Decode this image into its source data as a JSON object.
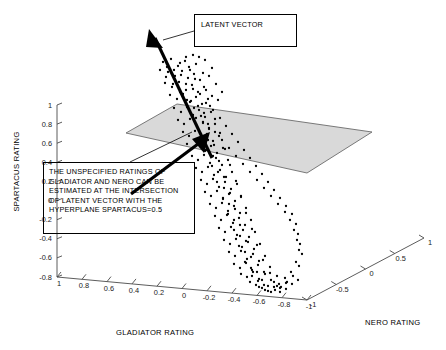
{
  "chart_data": {
    "type": "scatter",
    "title": "",
    "projection": "3d",
    "xlabel": "GLADIATOR RATING",
    "ylabel": "SPARTACUS RATING",
    "zlabel": "NERO RATING",
    "xlim": [
      1,
      -1
    ],
    "ylim": [
      -0.8,
      1
    ],
    "zlim": [
      -1,
      1
    ],
    "grid": false,
    "legend": null,
    "xticks": [
      "1",
      "0.8",
      "0.6",
      "0.4",
      "0.2",
      "0",
      "-0.2",
      "-0.4",
      "-0.6",
      "-0.8",
      "-1"
    ],
    "yticks": [
      "1",
      "0.8",
      "0.6",
      "0.4",
      "0.2",
      "0",
      "-0.2",
      "-0.4",
      "-0.6",
      "-0.8"
    ],
    "zticks": [
      "-1",
      "-0.5",
      "0",
      "0.5",
      "1"
    ],
    "annotations": [
      {
        "name": "latent-vector",
        "text": "LATENT VECTOR"
      },
      {
        "name": "hyperplane-explanation",
        "text": "THE UNSPECIFIED RATINGS OF\nGLADIATOR AND NERO CAN BE\nESTIMATED AT THE INTERSECTION\nOF LATENT VECTOR WITH THE\nHYPERPLANE SPARTACUS=0.5"
      }
    ],
    "surfaces": [
      {
        "name": "hyperplane",
        "description": "SPARTACUS = 0.5",
        "color": "#d9d9d9"
      }
    ],
    "vectors": [
      {
        "name": "latent-vector",
        "color": "#000000",
        "double_headed": true
      }
    ],
    "points_px": [
      [
        163,
        62
      ],
      [
        171,
        59
      ],
      [
        178,
        66
      ],
      [
        185,
        61
      ],
      [
        190,
        70
      ],
      [
        196,
        64
      ],
      [
        168,
        72
      ],
      [
        175,
        76
      ],
      [
        182,
        71
      ],
      [
        188,
        78
      ],
      [
        194,
        74
      ],
      [
        200,
        80
      ],
      [
        165,
        83
      ],
      [
        172,
        87
      ],
      [
        179,
        82
      ],
      [
        186,
        90
      ],
      [
        192,
        85
      ],
      [
        198,
        92
      ],
      [
        204,
        87
      ],
      [
        170,
        95
      ],
      [
        177,
        99
      ],
      [
        183,
        94
      ],
      [
        190,
        102
      ],
      [
        196,
        97
      ],
      [
        202,
        104
      ],
      [
        208,
        99
      ],
      [
        174,
        108
      ],
      [
        181,
        112
      ],
      [
        187,
        107
      ],
      [
        193,
        115
      ],
      [
        199,
        110
      ],
      [
        205,
        117
      ],
      [
        211,
        112
      ],
      [
        178,
        120
      ],
      [
        184,
        124
      ],
      [
        190,
        119
      ],
      [
        197,
        127
      ],
      [
        203,
        122
      ],
      [
        209,
        129
      ],
      [
        215,
        124
      ],
      [
        183,
        132
      ],
      [
        189,
        136
      ],
      [
        195,
        131
      ],
      [
        201,
        139
      ],
      [
        207,
        134
      ],
      [
        213,
        141
      ],
      [
        219,
        136
      ],
      [
        187,
        144
      ],
      [
        193,
        148
      ],
      [
        199,
        143
      ],
      [
        205,
        151
      ],
      [
        211,
        146
      ],
      [
        217,
        153
      ],
      [
        223,
        148
      ],
      [
        192,
        156
      ],
      [
        198,
        160
      ],
      [
        204,
        155
      ],
      [
        210,
        163
      ],
      [
        216,
        158
      ],
      [
        222,
        165
      ],
      [
        228,
        160
      ],
      [
        196,
        168
      ],
      [
        202,
        172
      ],
      [
        208,
        167
      ],
      [
        214,
        175
      ],
      [
        220,
        170
      ],
      [
        226,
        177
      ],
      [
        232,
        172
      ],
      [
        201,
        180
      ],
      [
        207,
        184
      ],
      [
        213,
        179
      ],
      [
        219,
        187
      ],
      [
        225,
        182
      ],
      [
        231,
        189
      ],
      [
        237,
        184
      ],
      [
        205,
        192
      ],
      [
        211,
        196
      ],
      [
        217,
        191
      ],
      [
        223,
        199
      ],
      [
        229,
        194
      ],
      [
        235,
        201
      ],
      [
        241,
        196
      ],
      [
        210,
        204
      ],
      [
        216,
        208
      ],
      [
        222,
        203
      ],
      [
        228,
        211
      ],
      [
        234,
        206
      ],
      [
        240,
        213
      ],
      [
        246,
        208
      ],
      [
        215,
        216
      ],
      [
        221,
        220
      ],
      [
        227,
        215
      ],
      [
        233,
        223
      ],
      [
        239,
        218
      ],
      [
        245,
        225
      ],
      [
        251,
        220
      ],
      [
        219,
        228
      ],
      [
        225,
        232
      ],
      [
        231,
        227
      ],
      [
        237,
        235
      ],
      [
        243,
        230
      ],
      [
        249,
        237
      ],
      [
        255,
        232
      ],
      [
        224,
        240
      ],
      [
        230,
        244
      ],
      [
        236,
        239
      ],
      [
        242,
        247
      ],
      [
        248,
        242
      ],
      [
        254,
        249
      ],
      [
        260,
        244
      ],
      [
        229,
        252
      ],
      [
        235,
        256
      ],
      [
        241,
        251
      ],
      [
        247,
        259
      ],
      [
        253,
        254
      ],
      [
        259,
        261
      ],
      [
        265,
        256
      ],
      [
        234,
        264
      ],
      [
        240,
        268
      ],
      [
        246,
        263
      ],
      [
        252,
        270
      ],
      [
        258,
        265
      ],
      [
        264,
        272
      ],
      [
        270,
        267
      ],
      [
        241,
        274
      ],
      [
        247,
        277
      ],
      [
        253,
        272
      ],
      [
        259,
        279
      ],
      [
        265,
        274
      ],
      [
        271,
        280
      ],
      [
        277,
        276
      ],
      [
        250,
        282
      ],
      [
        256,
        285
      ],
      [
        262,
        280
      ],
      [
        268,
        286
      ],
      [
        274,
        282
      ],
      [
        280,
        288
      ],
      [
        286,
        283
      ],
      [
        262,
        288
      ],
      [
        268,
        291
      ],
      [
        274,
        287
      ],
      [
        280,
        292
      ],
      [
        286,
        289
      ],
      [
        292,
        284
      ],
      [
        298,
        280
      ],
      [
        167,
        67
      ],
      [
        174,
        70
      ],
      [
        181,
        75
      ],
      [
        189,
        67
      ],
      [
        195,
        79
      ],
      [
        203,
        73
      ],
      [
        186,
        84
      ],
      [
        193,
        89
      ],
      [
        200,
        94
      ],
      [
        206,
        90
      ],
      [
        191,
        101
      ],
      [
        198,
        106
      ],
      [
        204,
        113
      ],
      [
        210,
        106
      ],
      [
        196,
        118
      ],
      [
        203,
        123
      ],
      [
        209,
        128
      ],
      [
        215,
        119
      ],
      [
        201,
        134
      ],
      [
        208,
        140
      ],
      [
        214,
        145
      ],
      [
        220,
        133
      ],
      [
        206,
        150
      ],
      [
        213,
        156
      ],
      [
        219,
        161
      ],
      [
        225,
        149
      ],
      [
        212,
        166
      ],
      [
        218,
        172
      ],
      [
        224,
        177
      ],
      [
        230,
        165
      ],
      [
        217,
        182
      ],
      [
        224,
        188
      ],
      [
        230,
        193
      ],
      [
        236,
        181
      ],
      [
        223,
        198
      ],
      [
        229,
        204
      ],
      [
        235,
        209
      ],
      [
        241,
        197
      ],
      [
        228,
        214
      ],
      [
        234,
        220
      ],
      [
        240,
        225
      ],
      [
        246,
        213
      ],
      [
        234,
        230
      ],
      [
        240,
        236
      ],
      [
        246,
        241
      ],
      [
        252,
        229
      ],
      [
        239,
        246
      ],
      [
        245,
        252
      ],
      [
        251,
        257
      ],
      [
        257,
        245
      ],
      [
        245,
        262
      ],
      [
        251,
        268
      ],
      [
        257,
        272
      ],
      [
        263,
        260
      ],
      [
        252,
        276
      ],
      [
        258,
        281
      ],
      [
        264,
        285
      ],
      [
        270,
        273
      ],
      [
        259,
        287
      ],
      [
        265,
        290
      ],
      [
        271,
        292
      ],
      [
        277,
        286
      ],
      [
        160,
        70
      ],
      [
        166,
        77
      ],
      [
        173,
        84
      ],
      [
        180,
        92
      ],
      [
        187,
        100
      ],
      [
        194,
        108
      ],
      [
        201,
        116
      ],
      [
        208,
        124
      ],
      [
        215,
        132
      ],
      [
        222,
        140
      ],
      [
        229,
        148
      ],
      [
        236,
        156
      ],
      [
        243,
        164
      ],
      [
        250,
        172
      ],
      [
        257,
        180
      ],
      [
        264,
        188
      ],
      [
        271,
        196
      ],
      [
        278,
        204
      ],
      [
        285,
        212
      ],
      [
        290,
        220
      ],
      [
        294,
        230
      ],
      [
        297,
        240
      ],
      [
        299,
        250
      ],
      [
        296,
        262
      ],
      [
        291,
        272
      ],
      [
        285,
        278
      ],
      [
        279,
        284
      ],
      [
        205,
        60
      ],
      [
        212,
        68
      ],
      [
        199,
        57
      ],
      [
        193,
        55
      ],
      [
        186,
        57
      ],
      [
        180,
        63
      ],
      [
        209,
        76
      ],
      [
        216,
        84
      ],
      [
        222,
        92
      ],
      [
        218,
        100
      ],
      [
        212,
        96
      ],
      [
        206,
        103
      ],
      [
        213,
        110
      ],
      [
        220,
        118
      ],
      [
        226,
        126
      ],
      [
        232,
        134
      ],
      [
        238,
        142
      ],
      [
        244,
        150
      ],
      [
        250,
        158
      ],
      [
        256,
        166
      ],
      [
        262,
        174
      ],
      [
        268,
        182
      ],
      [
        274,
        190
      ],
      [
        280,
        198
      ],
      [
        286,
        206
      ],
      [
        292,
        214
      ],
      [
        296,
        224
      ],
      [
        298,
        234
      ],
      [
        300,
        244
      ],
      [
        302,
        254
      ],
      [
        299,
        266
      ],
      [
        293,
        276
      ],
      [
        287,
        282
      ],
      [
        281,
        287
      ],
      [
        275,
        290
      ]
    ]
  }
}
